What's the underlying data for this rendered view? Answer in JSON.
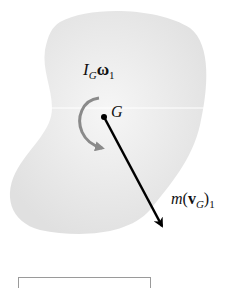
{
  "diagram": {
    "type": "rigid-body-momentum-diagram",
    "body_fill": "#e6e6e6",
    "labels": {
      "angular_momentum": {
        "main": "I",
        "sub": "G",
        "symbol": "ω",
        "sub2": "1"
      },
      "center_of_mass": "G",
      "linear_momentum": {
        "m": "m",
        "open": "(",
        "v": "v",
        "sub": "G",
        "close": ")",
        "sub2": "1"
      }
    },
    "colors": {
      "rotation_arrow": "#8a8a8a",
      "momentum_arrow": "#000000",
      "text": "#111111"
    }
  }
}
